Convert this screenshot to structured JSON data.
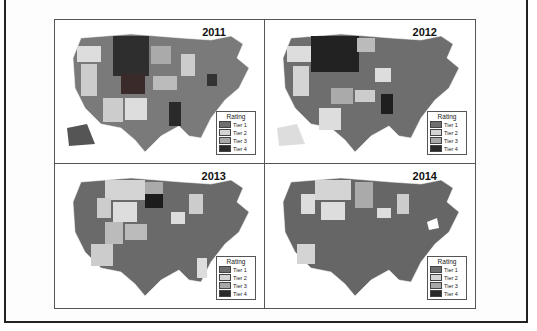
{
  "figure": {
    "panels": [
      {
        "year": "2011",
        "legend_title": "Rating",
        "tiers": [
          "Tier 1",
          "Tier 2",
          "Tier 3",
          "Tier 4"
        ]
      },
      {
        "year": "2012",
        "legend_title": "Rating",
        "tiers": [
          "Tier 1",
          "Tier 2",
          "Tier 3",
          "Tier 4"
        ]
      },
      {
        "year": "2013",
        "legend_title": "Rating",
        "tiers": [
          "Tier 1",
          "Tier 2",
          "Tier 3",
          "Tier 4"
        ]
      },
      {
        "year": "2014",
        "legend_title": "Rating",
        "tiers": [
          "Tier 1",
          "Tier 2",
          "Tier 3",
          "Tier 4"
        ]
      }
    ],
    "tier_colors": {
      "Tier 1": "#6e6e6e",
      "Tier 2": "#d4d4d4",
      "Tier 3": "#a8a8a8",
      "Tier 4": "#2a2a2a"
    },
    "state_labels_visible": [
      "WA",
      "OR",
      "CA",
      "NV",
      "ID",
      "MT",
      "WY",
      "UT",
      "AZ",
      "CO",
      "NM",
      "ND",
      "SD",
      "NE",
      "KS",
      "OK",
      "TX",
      "MN",
      "IA",
      "MO",
      "AR",
      "LA",
      "WI",
      "IL",
      "MI",
      "IN",
      "OH",
      "KY",
      "TN",
      "MS",
      "AL",
      "GA",
      "FL",
      "SC",
      "NC",
      "VA",
      "WV",
      "PA",
      "NY",
      "ME",
      "NH",
      "VT",
      "MA",
      "RI",
      "CT",
      "NJ",
      "DE",
      "MD",
      "DC",
      "AK",
      "HI"
    ]
  }
}
